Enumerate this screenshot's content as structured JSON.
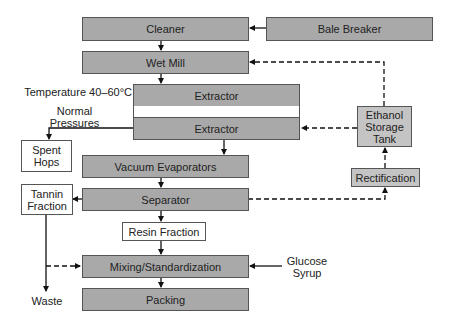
{
  "diagram": {
    "type": "process-flowchart",
    "nodes": {
      "cleaner": "Cleaner",
      "bale_breaker": "Bale Breaker",
      "wet_mill": "Wet Mill",
      "extractor_1": "Extractor",
      "extractor_2": "Extractor",
      "spent_hops": "Spent Hops",
      "vacuum_evaporators": "Vacuum Evaporators",
      "ethanol_storage_tank": "Ethanol Storage Tank",
      "rectification": "Rectification",
      "tannin_fraction": "Tannin Fraction",
      "separator": "Separator",
      "resin_fraction": "Resin Fraction",
      "mixing": "Mixing/Standardization",
      "packing": "Packing"
    },
    "labels": {
      "temperature": "Temperature 40–60°C",
      "pressure": "Normal Pressures",
      "glucose_syrup": "Glucose Syrup",
      "waste": "Waste"
    },
    "edges": [
      {
        "from": "Bale Breaker",
        "to": "Cleaner",
        "style": "solid"
      },
      {
        "from": "Cleaner",
        "to": "Wet Mill",
        "style": "solid"
      },
      {
        "from": "Wet Mill",
        "to": "Extractor",
        "style": "solid"
      },
      {
        "from": "Extractor",
        "to": "Extractor",
        "style": "solid"
      },
      {
        "from": "Extractor",
        "to": "Spent Hops",
        "style": "solid"
      },
      {
        "from": "Extractor",
        "to": "Vacuum Evaporators",
        "style": "solid"
      },
      {
        "from": "Ethanol Storage Tank",
        "to": "Extractor",
        "style": "dashed"
      },
      {
        "from": "Ethanol Storage Tank",
        "to": "Wet Mill",
        "style": "dashed"
      },
      {
        "from": "Rectification",
        "to": "Ethanol Storage Tank",
        "style": "dashed"
      },
      {
        "from": "Vacuum Evaporators",
        "to": "Separator",
        "style": "solid"
      },
      {
        "from": "Separator",
        "to": "Tannin Fraction",
        "style": "solid"
      },
      {
        "from": "Separator",
        "to": "Rectification",
        "style": "dashed"
      },
      {
        "from": "Separator",
        "to": "Resin Fraction",
        "style": "solid"
      },
      {
        "from": "Resin Fraction",
        "to": "Mixing/Standardization",
        "style": "solid"
      },
      {
        "from": "Tannin Fraction",
        "to": "Waste",
        "style": "solid"
      },
      {
        "from": "Tannin Fraction",
        "to": "Mixing/Standardization",
        "style": "dashed"
      },
      {
        "from": "Glucose Syrup",
        "to": "Mixing/Standardization",
        "style": "solid"
      },
      {
        "from": "Mixing/Standardization",
        "to": "Packing",
        "style": "solid"
      }
    ],
    "colors": {
      "process_box": "#a9a9a9",
      "storage_box": "#c4c4c4",
      "output_box": "#ffffff",
      "line": "#111111"
    }
  }
}
